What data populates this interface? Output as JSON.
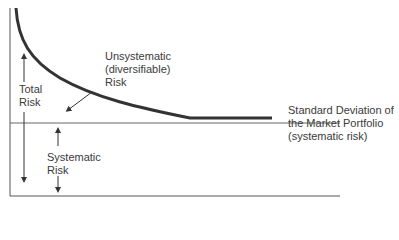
{
  "diagram": {
    "type": "risk-diversification-curve",
    "labels": {
      "unsystematic": [
        "Unsystematic",
        "(diversifiable)",
        "Risk"
      ],
      "total_risk": [
        "Total",
        "Risk"
      ],
      "systematic": [
        "Systematic",
        "Risk"
      ],
      "market_sd": [
        "Standard Deviation of",
        "the Market Portfolio",
        "(systematic risk)"
      ]
    },
    "colors": {
      "curve": "#333333",
      "axis": "#555555",
      "text": "#3a3a3a"
    }
  }
}
